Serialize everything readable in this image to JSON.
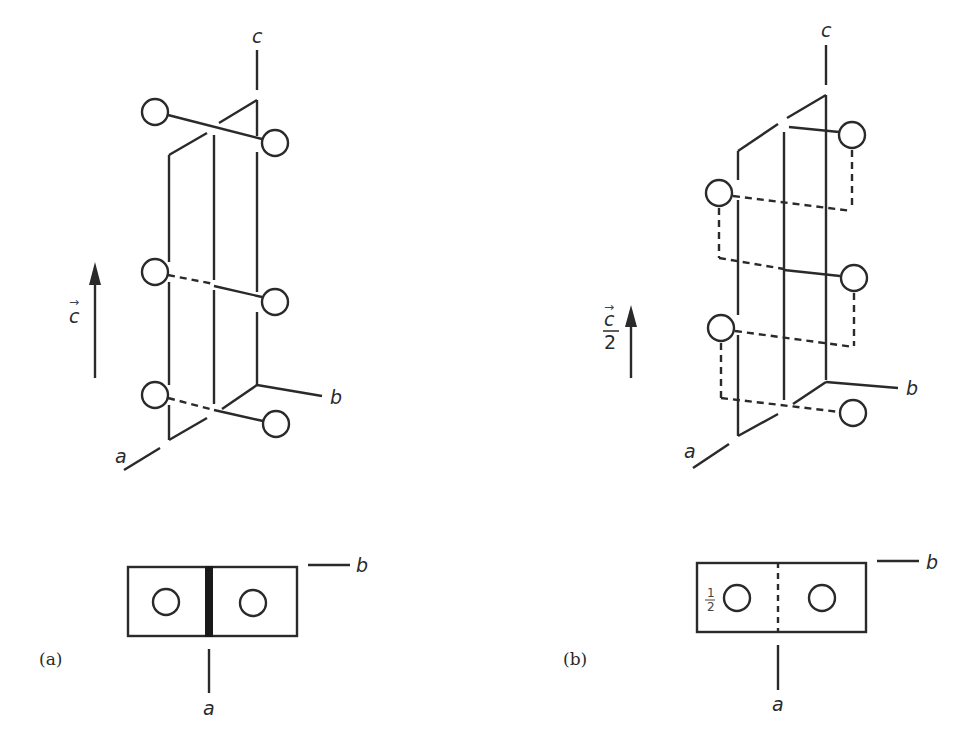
{
  "figure": {
    "colors": {
      "line": "#2a2a2a",
      "background": "#ffffff"
    }
  },
  "panel_a": {
    "label": "(a)",
    "axis_labels": {
      "a": "a",
      "b": "b",
      "c": "c"
    },
    "translation_arrow_label": "c",
    "translation_arrow_vector_mark": "→",
    "perspective": {
      "atoms": [
        {
          "id": "a-top-left",
          "cx": 155,
          "cy": 112
        },
        {
          "id": "a-top-right",
          "cx": 275,
          "cy": 143
        },
        {
          "id": "a-mid-left",
          "cx": 155,
          "cy": 272
        },
        {
          "id": "a-mid-right",
          "cx": 275,
          "cy": 302
        },
        {
          "id": "a-bot-left",
          "cx": 155,
          "cy": 395
        },
        {
          "id": "a-bot-right",
          "cx": 276,
          "cy": 424
        }
      ]
    },
    "projection": {
      "atoms": [
        {
          "cx": 166,
          "cy": 602
        },
        {
          "cx": 253,
          "cy": 603
        }
      ],
      "symmetry_element": "two-fold rotation axis (solid bar)"
    }
  },
  "panel_b": {
    "label": "(b)",
    "axis_labels": {
      "a": "a",
      "b": "b",
      "c": "c"
    },
    "translation_arrow_label_num": "c",
    "translation_arrow_label_den": "2",
    "translation_arrow_vector_mark": "→",
    "perspective": {
      "atoms": [
        {
          "id": "b-top-right",
          "cx": 852,
          "cy": 135
        },
        {
          "id": "b-upper-left",
          "cx": 719,
          "cy": 193
        },
        {
          "id": "b-mid-right",
          "cx": 854,
          "cy": 278
        },
        {
          "id": "b-lower-left",
          "cx": 721,
          "cy": 328
        },
        {
          "id": "b-bot-right",
          "cx": 853,
          "cy": 413
        }
      ]
    },
    "projection": {
      "atoms": [
        {
          "cx": 737,
          "cy": 598,
          "height_label": "1/2"
        },
        {
          "cx": 822,
          "cy": 598
        }
      ],
      "height_label_num": "1",
      "height_label_den": "2",
      "symmetry_element": "two-fold screw axis (dashed line)"
    }
  }
}
